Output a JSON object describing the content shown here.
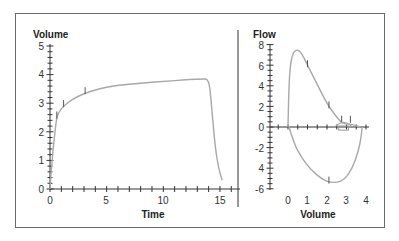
{
  "chart_data": [
    {
      "type": "line",
      "title": "",
      "xlabel": "Time",
      "ylabel": "Volume",
      "xlim": [
        0,
        16.3
      ],
      "ylim": [
        0,
        5
      ],
      "x_ticks": [
        "0",
        "5",
        "10",
        "15"
      ],
      "y_ticks": [
        "0",
        "1",
        "2",
        "3",
        "4",
        "5"
      ],
      "grid": false,
      "series": [
        {
          "name": "Volume-Time curve",
          "color": "#a8a8a8",
          "x": [
            0.0,
            0.1,
            0.3,
            0.5,
            0.6,
            0.8,
            1.2,
            2.0,
            3.1,
            4.0,
            5.0,
            6.0,
            8.0,
            10.0,
            12.0,
            13.5,
            13.9,
            14.1,
            14.3,
            14.6,
            14.9,
            15.2
          ],
          "y": [
            0.0,
            0.6,
            1.5,
            2.2,
            2.5,
            2.7,
            2.9,
            3.15,
            3.35,
            3.47,
            3.56,
            3.62,
            3.7,
            3.76,
            3.82,
            3.85,
            3.84,
            3.6,
            2.7,
            1.4,
            0.7,
            0.3
          ]
        }
      ],
      "annotations": [
        {
          "type": "tick-mark",
          "x": 0.6,
          "y": 2.5
        },
        {
          "type": "tick-mark",
          "x": 1.2,
          "y": 2.9
        },
        {
          "type": "tick-mark",
          "x": 3.1,
          "y": 3.35
        }
      ]
    },
    {
      "type": "line",
      "title": "",
      "xlabel": "Volume",
      "ylabel": "Flow",
      "xlim": [
        -0.9,
        4.1
      ],
      "ylim": [
        -6,
        8
      ],
      "x_ticks": [
        "0",
        "1",
        "2",
        "3",
        "4"
      ],
      "y_ticks": [
        "8",
        "6",
        "4",
        "2",
        "0",
        "-2",
        "4",
        "-6"
      ],
      "grid": false,
      "series": [
        {
          "name": "Expiratory limb (positive flow)",
          "color": "#a8a8a8",
          "x": [
            0.0,
            0.03,
            0.1,
            0.25,
            0.45,
            0.6,
            0.8,
            1.0,
            1.4,
            1.8,
            2.1,
            2.4,
            2.7,
            2.9,
            3.1,
            3.4,
            3.7
          ],
          "y": [
            0.0,
            3.0,
            5.8,
            7.2,
            7.5,
            7.4,
            6.8,
            6.0,
            4.5,
            3.0,
            2.0,
            1.2,
            0.5,
            0.3,
            0.3,
            0.2,
            0.0
          ]
        },
        {
          "name": "Inspiratory limb (negative flow)",
          "color": "#a8a8a8",
          "x": [
            0.05,
            0.3,
            0.7,
            1.2,
            1.7,
            2.1,
            2.5,
            2.9,
            3.3,
            3.6,
            3.75,
            3.8
          ],
          "y": [
            0.0,
            -1.6,
            -3.0,
            -4.2,
            -5.0,
            -5.35,
            -5.4,
            -5.1,
            -4.0,
            -2.4,
            -1.0,
            0.0
          ]
        }
      ],
      "annotations": [
        {
          "type": "tick-mark",
          "x": 1.0,
          "y": 6.0
        },
        {
          "type": "tick-mark",
          "x": 2.1,
          "y": 2.0
        },
        {
          "type": "tick-mark",
          "x": 2.75,
          "y": 0.6
        },
        {
          "type": "tick-mark",
          "x": 3.2,
          "y": 0.6
        },
        {
          "type": "tick-mark",
          "x": 2.1,
          "y": -5.3
        },
        {
          "type": "box",
          "x": [
            2.6,
            3.1
          ],
          "y": [
            -0.3,
            0.1
          ]
        }
      ]
    }
  ],
  "left_chart": {
    "y_title": "Volume",
    "x_title": "Time",
    "y_labels": [
      "0",
      "1",
      "2",
      "3",
      "4",
      "5"
    ],
    "x_labels": [
      "0",
      "5",
      "10",
      "15"
    ]
  },
  "right_chart": {
    "y_title": "Flow",
    "x_title": "Volume",
    "y_labels": [
      "8",
      "6",
      "4",
      "2",
      "0",
      "-2",
      "4",
      "-6"
    ],
    "x_labels": [
      "0",
      "1",
      "2",
      "3",
      "4"
    ]
  }
}
